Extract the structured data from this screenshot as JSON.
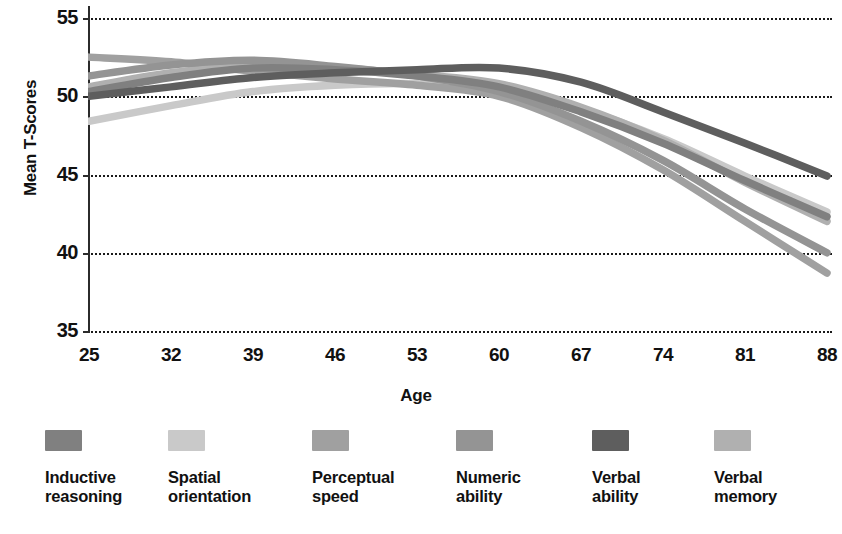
{
  "chart_data": {
    "type": "line",
    "title": "",
    "xlabel": "Age",
    "ylabel": "Mean T-Scores",
    "xlim": [
      25,
      88
    ],
    "ylim": [
      35,
      55
    ],
    "grid": true,
    "legend_position": "bottom",
    "x_ticks": [
      "25",
      "32",
      "39",
      "46",
      "53",
      "60",
      "67",
      "74",
      "81",
      "88"
    ],
    "y_ticks": [
      "55",
      "50",
      "45",
      "40",
      "35"
    ],
    "x": [
      25,
      32,
      39,
      46,
      53,
      60,
      67,
      74,
      81,
      88
    ],
    "series": [
      {
        "name": "Inductive reasoning",
        "color": "#808080",
        "values": [
          50.3,
          51.2,
          51.8,
          51.7,
          51.3,
          50.6,
          49.0,
          47.0,
          44.6,
          42.3
        ]
      },
      {
        "name": "Spatial orientation",
        "color": "#c9c9c9",
        "values": [
          48.4,
          49.4,
          50.3,
          50.7,
          50.8,
          50.5,
          49.2,
          47.3,
          44.9,
          42.6
        ]
      },
      {
        "name": "Perceptual speed",
        "color": "#a0a0a0",
        "values": [
          52.5,
          52.2,
          51.6,
          51.1,
          50.7,
          50.0,
          48.0,
          45.3,
          42.0,
          38.7
        ]
      },
      {
        "name": "Numeric ability",
        "color": "#949494",
        "values": [
          51.3,
          52.0,
          52.3,
          51.9,
          51.3,
          50.3,
          48.4,
          45.9,
          42.8,
          40.0
        ]
      },
      {
        "name": "Verbal ability",
        "color": "#5e5e5e",
        "values": [
          50.0,
          50.6,
          51.2,
          51.5,
          51.7,
          51.8,
          50.9,
          49.0,
          47.0,
          44.9
        ]
      },
      {
        "name": "Verbal memory",
        "color": "#b0b0b0",
        "values": [
          50.6,
          51.5,
          51.9,
          51.8,
          51.4,
          50.8,
          49.3,
          47.2,
          44.5,
          42.0
        ]
      }
    ]
  },
  "axes": {
    "y_title": "Mean T-Scores",
    "x_title": "Age",
    "y_ticks": [
      {
        "label": "55",
        "value": 55
      },
      {
        "label": "50",
        "value": 50
      },
      {
        "label": "45",
        "value": 45
      },
      {
        "label": "40",
        "value": 40
      },
      {
        "label": "35",
        "value": 35
      }
    ],
    "x_ticks": [
      {
        "label": "25",
        "value": 25
      },
      {
        "label": "32",
        "value": 32
      },
      {
        "label": "39",
        "value": 39
      },
      {
        "label": "46",
        "value": 46
      },
      {
        "label": "53",
        "value": 53
      },
      {
        "label": "60",
        "value": 60
      },
      {
        "label": "67",
        "value": 67
      },
      {
        "label": "74",
        "value": 74
      },
      {
        "label": "81",
        "value": 81
      },
      {
        "label": "88",
        "value": 88
      }
    ]
  },
  "legend": {
    "items": [
      {
        "label": "Inductive\nreasoning",
        "color": "#808080"
      },
      {
        "label": "Spatial\norientation",
        "color": "#c9c9c9"
      },
      {
        "label": "Perceptual\nspeed",
        "color": "#a0a0a0"
      },
      {
        "label": "Numeric\nability",
        "color": "#949494"
      },
      {
        "label": "Verbal\nability",
        "color": "#5e5e5e"
      },
      {
        "label": "Verbal\nmemory",
        "color": "#b0b0b0"
      }
    ]
  },
  "colors": {
    "axis": "#2b2b2b",
    "grid": "#1a1a1a",
    "text": "#111111",
    "background": "#ffffff"
  }
}
